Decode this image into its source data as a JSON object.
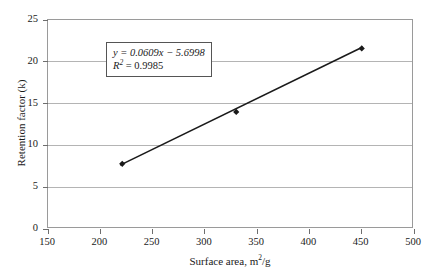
{
  "chart_data": {
    "type": "scatter",
    "title": "",
    "xlabel": "Surface area, m²/g",
    "ylabel": "Retention factor (k)",
    "xlim": [
      150,
      500
    ],
    "ylim": [
      0,
      25
    ],
    "xticks": [
      150,
      200,
      250,
      300,
      350,
      400,
      450,
      500
    ],
    "yticks": [
      0,
      5,
      10,
      15,
      20,
      25
    ],
    "grid": "horizontal",
    "legend": "none",
    "series": [
      {
        "name": "Retention factor vs surface area",
        "marker": "filled-diamond",
        "color": "#1a1a1a",
        "x": [
          221,
          330,
          450
        ],
        "y": [
          7.8,
          14.0,
          21.6
        ]
      }
    ],
    "trendline": {
      "type": "linear",
      "slope": 0.0609,
      "intercept": -5.6998,
      "r_squared": 0.9985,
      "x_start": 219,
      "x_end": 451,
      "color": "#1a1a1a"
    },
    "annotations": {
      "equation_line1": "y = 0.0609x − 5.6998",
      "equation_line2_base": "R",
      "equation_line2_exp": "2",
      "equation_line2_rest": " = 0.9985"
    }
  },
  "axes": {
    "x_tick_labels": [
      "150",
      "200",
      "250",
      "300",
      "350",
      "400",
      "450",
      "500"
    ],
    "y_tick_labels": [
      "0",
      "5",
      "10",
      "15",
      "20",
      "25"
    ],
    "x_title_text": "Surface area, m",
    "x_title_sup": "2",
    "x_title_tail": "/g",
    "y_title": "Retention factor (k)"
  },
  "colors": {
    "frame": "#9a9a9a",
    "gridline": "#b4b4b4",
    "data": "#1a1a1a",
    "background": "#ffffff",
    "box_border": "#555555"
  }
}
